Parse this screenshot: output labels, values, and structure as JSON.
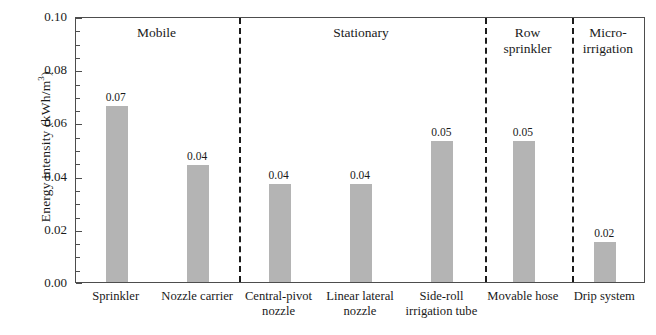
{
  "chart_data": {
    "type": "bar",
    "title": "",
    "xlabel": "",
    "ylabel": "Energy intensity (kWh/m3)",
    "ylabel_prefix": "Energy intensity (kWh/m",
    "ylabel_sup": "3",
    "ylabel_suffix": ")",
    "ylim": [
      0,
      0.1
    ],
    "ytick_labels": [
      "0.00",
      "0.02",
      "0.04",
      "0.06",
      "0.08",
      "0.10"
    ],
    "ytick_values": [
      0,
      0.02,
      0.04,
      0.06,
      0.08,
      0.1
    ],
    "minor_tick_step": 0.005,
    "grid": false,
    "legend": "none",
    "bar_color": "#b4b4b4",
    "axis_color": "#4d4d4d",
    "categories": [
      "Sprinkler",
      "Nozzle carrier",
      "Central-pivot nozzle",
      "Linear lateral nozzle",
      "Side-roll irrigation tube",
      "Movable hose",
      "Drip system"
    ],
    "category_lines": [
      [
        "Sprinkler"
      ],
      [
        "Nozzle carrier"
      ],
      [
        "Central-pivot",
        "nozzle"
      ],
      [
        "Linear lateral",
        "nozzle"
      ],
      [
        "Side-roll",
        "irrigation tube"
      ],
      [
        "Movable hose"
      ],
      [
        "Drip system"
      ]
    ],
    "values": [
      0.066,
      0.044,
      0.037,
      0.037,
      0.053,
      0.053,
      0.015
    ],
    "data_labels": [
      "0.07",
      "0.04",
      "0.04",
      "0.04",
      "0.05",
      "0.05",
      "0.02"
    ],
    "groups": [
      {
        "label_lines": [
          "Mobile"
        ],
        "members": [
          0,
          1
        ]
      },
      {
        "label_lines": [
          "Stationary"
        ],
        "members": [
          2,
          3,
          4
        ]
      },
      {
        "label_lines": [
          "Row",
          "sprinkler"
        ],
        "members": [
          5
        ]
      },
      {
        "label_lines": [
          "Micro-",
          "irrigation"
        ],
        "members": [
          6
        ]
      }
    ],
    "divider_positions_fraction": [
      0.286,
      0.7175,
      0.8702
    ]
  }
}
